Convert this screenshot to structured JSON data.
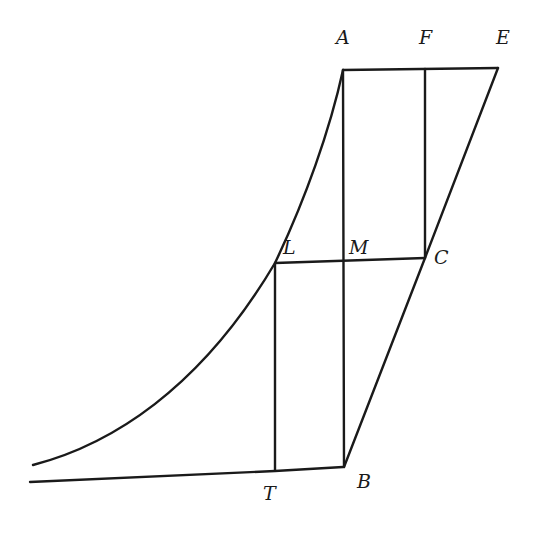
{
  "diagram": {
    "stroke_color": "#1a1a1a",
    "background": "#ffffff",
    "points": {
      "A": {
        "label": "A",
        "x": 343,
        "y": 70
      },
      "F": {
        "label": "F",
        "x": 425,
        "y": 69
      },
      "E": {
        "label": "E",
        "x": 498,
        "y": 68
      },
      "L": {
        "label": "L",
        "x": 275,
        "y": 263
      },
      "M": {
        "label": "M",
        "x": 343,
        "y": 261
      },
      "C": {
        "label": "C",
        "x": 425,
        "y": 258
      },
      "T": {
        "label": "T",
        "x": 275,
        "y": 470
      },
      "B": {
        "label": "B",
        "x": 343,
        "y": 467
      }
    },
    "segments": [
      "AE",
      "AB",
      "FC",
      "EB",
      "LC",
      "LT",
      "TB",
      "baseline"
    ],
    "curve": "logarithmic-type curve from lower-left asymptote through L to A"
  }
}
